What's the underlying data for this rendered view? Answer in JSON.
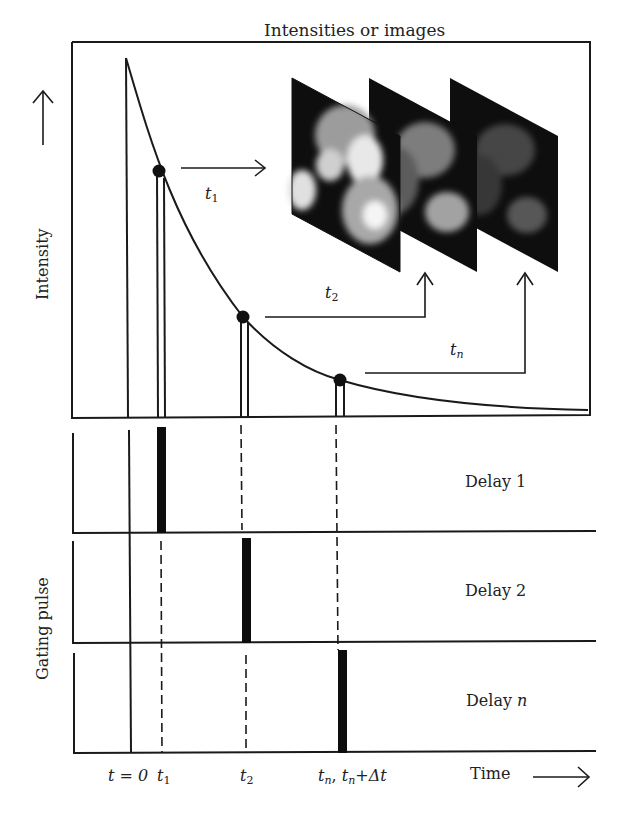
{
  "title": "Intensities or images",
  "axes": {
    "y_top_label": "Intensity",
    "y_bottom_label": "Gating pulse",
    "x_label": "Time"
  },
  "time_markers": [
    {
      "id": "t0",
      "text": "t = 0"
    },
    {
      "id": "t1",
      "base": "t",
      "sub": "1"
    },
    {
      "id": "t2",
      "base": "t",
      "sub": "2"
    },
    {
      "id": "tn",
      "text_a": "t",
      "sub_a": "n",
      "sep": ", ",
      "text_b": "t",
      "sub_b": "n",
      "tail": "+Δt"
    }
  ],
  "arrow_labels": {
    "t1": {
      "base": "t",
      "sub": "1"
    },
    "t2": {
      "base": "t",
      "sub": "2"
    },
    "tn": {
      "base": "t",
      "sub": "n"
    }
  },
  "delays": [
    {
      "label": "Delay 1"
    },
    {
      "label": "Delay 2"
    },
    {
      "label_base": "Delay ",
      "label_var": "n"
    }
  ],
  "images": [
    {
      "name": "image-t1",
      "brightness": 1.0
    },
    {
      "name": "image-t2",
      "brightness": 0.72
    },
    {
      "name": "image-tn",
      "brightness": 0.45
    }
  ],
  "colors": {
    "line": "#1a1a1a",
    "background": "#ffffff"
  }
}
